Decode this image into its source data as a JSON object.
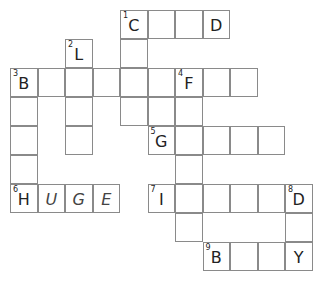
{
  "puzzle": {
    "cells": [
      {
        "r": 0,
        "c": 4,
        "num": "1",
        "letter": "C"
      },
      {
        "r": 0,
        "c": 5
      },
      {
        "r": 0,
        "c": 6
      },
      {
        "r": 0,
        "c": 7,
        "letter": "D"
      },
      {
        "r": 1,
        "c": 2,
        "num": "2",
        "letter": "L"
      },
      {
        "r": 1,
        "c": 4
      },
      {
        "r": 2,
        "c": 0,
        "num": "3",
        "letter": "B"
      },
      {
        "r": 2,
        "c": 1
      },
      {
        "r": 2,
        "c": 2
      },
      {
        "r": 2,
        "c": 3
      },
      {
        "r": 2,
        "c": 4
      },
      {
        "r": 2,
        "c": 5
      },
      {
        "r": 2,
        "c": 6,
        "num": "4",
        "letter": "F"
      },
      {
        "r": 2,
        "c": 7
      },
      {
        "r": 2,
        "c": 8
      },
      {
        "r": 3,
        "c": 0
      },
      {
        "r": 3,
        "c": 2
      },
      {
        "r": 3,
        "c": 4
      },
      {
        "r": 3,
        "c": 5
      },
      {
        "r": 3,
        "c": 6
      },
      {
        "r": 4,
        "c": 0
      },
      {
        "r": 4,
        "c": 2
      },
      {
        "r": 4,
        "c": 5,
        "num": "5",
        "letter": "G"
      },
      {
        "r": 4,
        "c": 6
      },
      {
        "r": 4,
        "c": 7
      },
      {
        "r": 4,
        "c": 8
      },
      {
        "r": 4,
        "c": 9
      },
      {
        "r": 5,
        "c": 0
      },
      {
        "r": 5,
        "c": 6
      },
      {
        "r": 6,
        "c": 0,
        "num": "6",
        "letter": "H"
      },
      {
        "r": 6,
        "c": 1,
        "letter": "U",
        "italic": true
      },
      {
        "r": 6,
        "c": 2,
        "letter": "G",
        "italic": true
      },
      {
        "r": 6,
        "c": 3,
        "letter": "E",
        "italic": true
      },
      {
        "r": 6,
        "c": 5,
        "num": "7",
        "letter": "I"
      },
      {
        "r": 6,
        "c": 6
      },
      {
        "r": 6,
        "c": 7
      },
      {
        "r": 6,
        "c": 8
      },
      {
        "r": 6,
        "c": 9
      },
      {
        "r": 6,
        "c": 10,
        "num": "8",
        "letter": "D"
      },
      {
        "r": 7,
        "c": 6
      },
      {
        "r": 7,
        "c": 10
      },
      {
        "r": 8,
        "c": 7,
        "num": "9",
        "letter": "B"
      },
      {
        "r": 8,
        "c": 8
      },
      {
        "r": 8,
        "c": 9
      },
      {
        "r": 8,
        "c": 10,
        "letter": "Y"
      }
    ]
  }
}
